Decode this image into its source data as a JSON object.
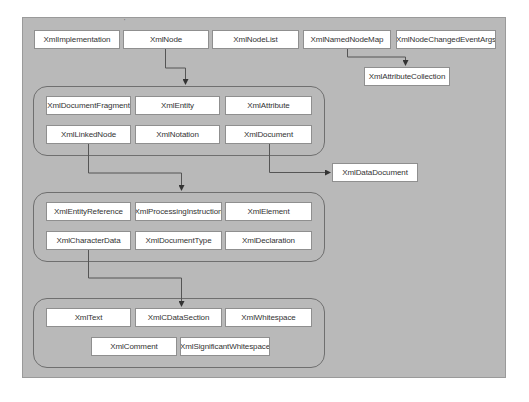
{
  "diagram": {
    "title": "",
    "colors": {
      "panel": "#b9b9b9",
      "box": "#ffffff",
      "line": "#555555"
    },
    "top_row": [
      "XmlImplementation",
      "XmlNode",
      "XmlNodeList",
      "XmlNamedNodeMap",
      "XmlNodeChangedEventArgs"
    ],
    "attribute_collection": "XmlAttributeCollection",
    "group1": {
      "row1": [
        "XmlDocumentFragment",
        "XmlEntity",
        "XmlAttribute"
      ],
      "row2": [
        "XmlLinkedNode",
        "XmlNotation",
        "XmlDocument"
      ]
    },
    "data_document": "XmlDataDocument",
    "group2": {
      "row1": [
        "XmlEntityReference",
        "XmlProcessingInstruction",
        "XmlElement"
      ],
      "row2": [
        "XmlCharacterData",
        "XmlDocumentType",
        "XmlDeclaration"
      ]
    },
    "group3": {
      "row1": [
        "XmlText",
        "XmlCDataSection",
        "XmlWhitespace"
      ],
      "row2": [
        "XmlComment",
        "XmlSignificantWhitespace"
      ]
    },
    "edges": [
      {
        "from": "XmlNode",
        "to": "group1"
      },
      {
        "from": "XmlNamedNodeMap",
        "to": "XmlAttributeCollection"
      },
      {
        "from": "XmlDocument",
        "to": "XmlDataDocument"
      },
      {
        "from": "XmlLinkedNode",
        "to": "group2"
      },
      {
        "from": "XmlCharacterData",
        "to": "group3"
      }
    ]
  }
}
